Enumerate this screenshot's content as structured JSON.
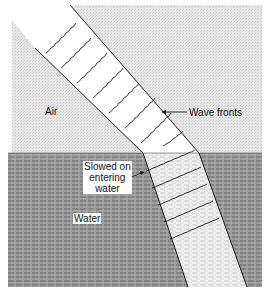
{
  "figure": {
    "type": "refraction-diagram",
    "media": [
      {
        "name": "Air",
        "label": "Air",
        "fill": "#e4e4e4"
      },
      {
        "name": "Water",
        "label": "Water",
        "fill": "#8f8f8f"
      }
    ],
    "annotations": {
      "wave_fronts": "Wave fronts",
      "slowed_line1": "Slowed on",
      "slowed_line2": "entering",
      "slowed_line3": "water"
    },
    "colors": {
      "air": "#e2e2e2",
      "water": "#8d8d8d",
      "beam_air": "#ffffff",
      "beam_water": "#e8e8e8",
      "line": "#1a1a1a"
    },
    "wave_front_count_air": 8,
    "wave_front_count_water": 5
  }
}
